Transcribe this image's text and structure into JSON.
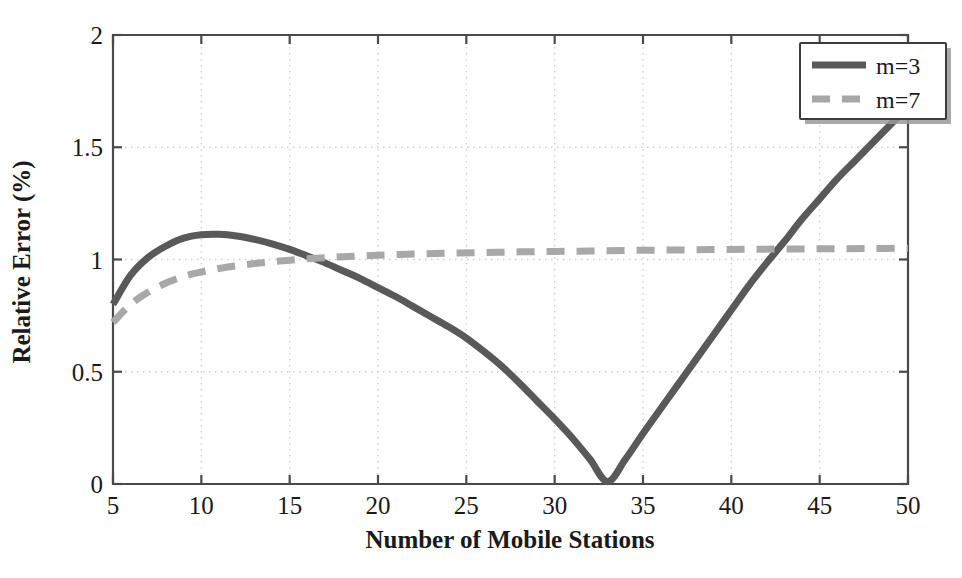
{
  "chart_data": {
    "type": "line",
    "title": "",
    "xlabel": "Number of Mobile Stations",
    "ylabel": "Relative Error (%)",
    "xlim": [
      5,
      50
    ],
    "ylim": [
      0,
      2
    ],
    "xticks": [
      5,
      10,
      15,
      20,
      25,
      30,
      35,
      40,
      45,
      50
    ],
    "xtick_labels": [
      "5",
      "10",
      "15",
      "20",
      "25",
      "30",
      "35",
      "40",
      "45",
      "50"
    ],
    "yticks": [
      0,
      0.5,
      1,
      1.5,
      2
    ],
    "ytick_labels": [
      "0",
      "0.5",
      "1",
      "1.5",
      "2"
    ],
    "grid": true,
    "grid_style": "dotted",
    "legend_position": "top-right",
    "series": [
      {
        "name": "m=3",
        "style": "solid",
        "color": "#595959",
        "width": 7,
        "x": [
          5,
          6,
          7,
          8,
          9,
          10,
          11,
          12,
          13,
          14,
          15,
          16,
          17,
          18,
          19,
          20,
          21,
          22,
          23,
          24,
          25,
          26,
          27,
          28,
          29,
          30,
          31,
          32,
          33,
          34,
          35,
          36,
          37,
          38,
          39,
          40,
          41,
          42,
          43,
          44,
          45,
          46,
          47,
          48,
          49,
          50
        ],
        "y": [
          0.8,
          0.93,
          1.01,
          1.06,
          1.095,
          1.11,
          1.112,
          1.105,
          1.09,
          1.07,
          1.045,
          1.015,
          0.985,
          0.95,
          0.915,
          0.875,
          0.835,
          0.79,
          0.745,
          0.7,
          0.65,
          0.59,
          0.525,
          0.45,
          0.37,
          0.29,
          0.205,
          0.11,
          0.01,
          0.11,
          0.225,
          0.335,
          0.445,
          0.555,
          0.665,
          0.775,
          0.885,
          0.985,
          1.08,
          1.18,
          1.27,
          1.36,
          1.44,
          1.52,
          1.6,
          1.68
        ]
      },
      {
        "name": "m=7",
        "style": "dashed",
        "color": "#a8a8a8",
        "width": 7,
        "dash": "18 12",
        "x": [
          5,
          6,
          7,
          8,
          9,
          10,
          11,
          12,
          13,
          14,
          15,
          16,
          17,
          18,
          19,
          20,
          22,
          24,
          26,
          28,
          30,
          32,
          34,
          36,
          38,
          40,
          42,
          44,
          46,
          48,
          50
        ],
        "y": [
          0.72,
          0.8,
          0.855,
          0.895,
          0.925,
          0.945,
          0.96,
          0.972,
          0.982,
          0.99,
          0.997,
          1.003,
          1.008,
          1.012,
          1.016,
          1.019,
          1.024,
          1.028,
          1.031,
          1.034,
          1.036,
          1.038,
          1.04,
          1.042,
          1.043,
          1.045,
          1.046,
          1.047,
          1.048,
          1.049,
          1.05
        ]
      }
    ]
  },
  "legend": {
    "entries": [
      {
        "label": "m=3"
      },
      {
        "label": "m=7"
      }
    ]
  },
  "colors": {
    "series_m3": "#595959",
    "series_m7": "#a8a8a8",
    "axis": "#4a4a4a",
    "grid": "#cfcfcf",
    "text": "#1a1a1a",
    "background": "#ffffff"
  }
}
